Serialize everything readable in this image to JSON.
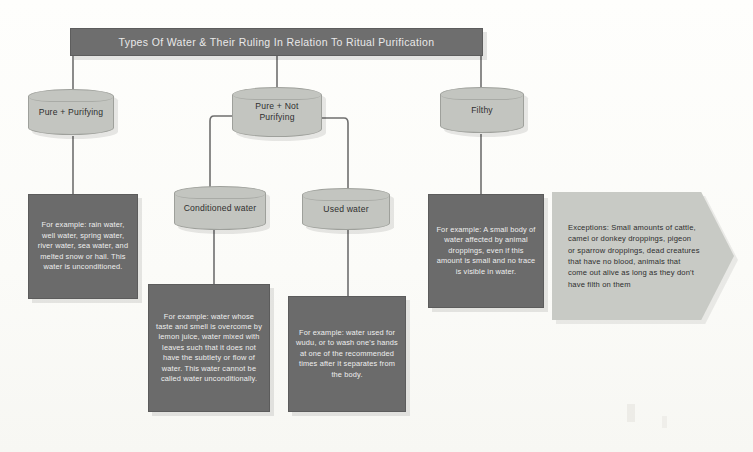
{
  "diagram": {
    "title": "Types Of Water & Their Ruling In Relation To Ritual Purification",
    "colors": {
      "banner": "#6e6e6e",
      "banner_text": "#e9e9e9",
      "node_fill": "#c3c5c0",
      "node_text": "#2f2f2f",
      "desc_fill": "#6b6b6b",
      "desc_text": "#efefef",
      "callout_fill": "#c8cac5",
      "callout_text": "#2e2e2e",
      "connector": "#6f6f6f",
      "background": "#fdfdfb"
    },
    "nodes": {
      "pure_purifying": "Pure + Purifying",
      "pure_not_purifying": "Pure + Not Purifying",
      "filthy": "Filthy",
      "conditioned_water": "Conditioned water",
      "used_water": "Used water"
    },
    "descriptions": {
      "pure_purifying": "For example: rain water, well water, spring water, river water, sea water, and melted snow or hail. This water is unconditioned.",
      "conditioned_water": "For example: water whose taste and smell is overcome by lemon juice, water mixed with leaves such that it does not have the subtlety or flow of water. This water cannot be called water unconditionally.",
      "used_water": "For example: water used for wudu, or to wash one's hands at one of the recommended times after it separates from the body.",
      "filthy": "For example: A small body of water affected by animal droppings, even if this amount is small and no trace is visible in water."
    },
    "callout": {
      "text": "Exceptions: Small amounts of cattle, camel or donkey droppings, pigeon or sparrow droppings, dead creatures that have no blood, animals that come out alive as long as they don't have filth on them"
    }
  }
}
